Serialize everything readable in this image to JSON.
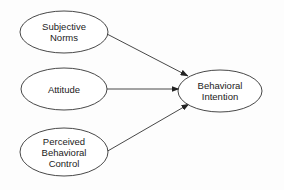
{
  "diagram": {
    "type": "flowchart",
    "title": "",
    "nodes": [
      {
        "id": "subjective_norms",
        "shape": "ellipse",
        "cx": 64,
        "cy": 32,
        "rx": 44,
        "ry": 21,
        "lines": [
          "Subjective",
          "Norms"
        ]
      },
      {
        "id": "attitude",
        "shape": "ellipse",
        "cx": 64,
        "cy": 89,
        "rx": 43,
        "ry": 21,
        "lines": [
          "Attitude"
        ]
      },
      {
        "id": "perceived_behavioral_control",
        "shape": "ellipse",
        "cx": 64,
        "cy": 152,
        "rx": 44,
        "ry": 24,
        "lines": [
          "Perceived",
          "Behavioral",
          "Control"
        ]
      },
      {
        "id": "behavioral_intention",
        "shape": "ellipse",
        "cx": 220,
        "cy": 91,
        "rx": 42,
        "ry": 21,
        "lines": [
          "Behavioral",
          "Intention"
        ]
      }
    ],
    "edges": [
      {
        "from": "subjective_norms",
        "to": "behavioral_intention",
        "x1": 107,
        "y1": 34,
        "x2": 188,
        "y2": 76,
        "arrow": "end"
      },
      {
        "from": "attitude",
        "to": "behavioral_intention",
        "x1": 107,
        "y1": 89,
        "x2": 179,
        "y2": 89,
        "arrow": "end"
      },
      {
        "from": "perceived_behavioral_control",
        "to": "behavioral_intention",
        "x1": 106,
        "y1": 152,
        "x2": 189,
        "y2": 104,
        "arrow": "end"
      }
    ]
  },
  "colors": {
    "stroke": "#333333",
    "fill": "#ffffff",
    "text": "#222222",
    "background": "#fdfdfd"
  }
}
